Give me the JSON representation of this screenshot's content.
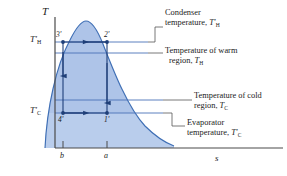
{
  "figure": {
    "type": "T-s diagram",
    "axes": {
      "y_label": "T",
      "x_label": "s",
      "y_axis_name": "temperature-axis",
      "x_axis_name": "entropy-axis"
    },
    "temperature_lines": [
      {
        "key": "TH_prime",
        "label_main": "T",
        "label_sub": "H",
        "prime": true,
        "y": 42,
        "name": "condenser-temperature-line"
      },
      {
        "key": "TH",
        "label_main": "T",
        "label_sub": "H",
        "prime": false,
        "y": 53,
        "name": "warm-region-temperature-line"
      },
      {
        "key": "TC",
        "label_main": "T",
        "label_sub": "C",
        "prime": false,
        "y": 100,
        "name": "cold-region-temperature-line"
      },
      {
        "key": "TC_prime",
        "label_main": "T",
        "label_sub": "C",
        "prime": true,
        "y": 113,
        "name": "evaporator-temperature-line"
      }
    ],
    "axis_tick_labels": [
      {
        "label": "b",
        "x": 63
      },
      {
        "label": "a",
        "x": 107
      }
    ],
    "state_points": [
      {
        "label": "3'",
        "x": 63,
        "y": 42,
        "name": "state-point-3-prime"
      },
      {
        "label": "2'",
        "x": 107,
        "y": 42,
        "name": "state-point-2-prime"
      },
      {
        "label": "4'",
        "x": 63,
        "y": 113,
        "name": "state-point-4-prime"
      },
      {
        "label": "1'",
        "x": 107,
        "y": 113,
        "name": "state-point-1-prime"
      }
    ],
    "annotations": [
      {
        "id": "condenser",
        "line1": "Condenser",
        "line2_pre": "temperature, ",
        "sym_main": "T",
        "sym_sub": "H",
        "sym_prime": true,
        "name": "annotation-condenser-temperature"
      },
      {
        "id": "warm-region",
        "line1": "Temperature of warm",
        "line2_pre": "region, ",
        "sym_main": "T",
        "sym_sub": "H",
        "sym_prime": false,
        "name": "annotation-warm-region-temperature"
      },
      {
        "id": "cold-region",
        "line1": "Temperature of cold",
        "line2_pre": "region, ",
        "sym_main": "T",
        "sym_sub": "C",
        "sym_prime": false,
        "name": "annotation-cold-region-temperature"
      },
      {
        "id": "evaporator",
        "line1": "Evaporator",
        "line2_pre": "temperature, ",
        "sym_main": "T",
        "sym_sub": "C",
        "sym_prime": true,
        "name": "annotation-evaporator-temperature"
      }
    ],
    "colors": {
      "dome_fill": "#aec4e8",
      "dome_fill_light": "#c3d4ee",
      "dome_stroke": "#3f6fb5",
      "line": "#4a72b8",
      "axis": "#4a4a4a",
      "text": "#1a1a1a",
      "leader": "#555555"
    }
  }
}
